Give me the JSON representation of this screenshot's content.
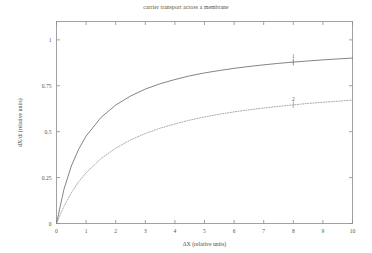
{
  "chart_data": {
    "type": "line",
    "title": "carrier transport across a membrane",
    "xlabel": "ΔX (relative units)",
    "ylabel": "dX/dt (relative units)",
    "xlim": [
      0,
      10
    ],
    "ylim": [
      0,
      1.1
    ],
    "grid": false,
    "legend": "inline-curve-labels",
    "xticks": [
      "0",
      "1",
      "2",
      "3",
      "4",
      "5",
      "6",
      "7",
      "8",
      "9",
      "10"
    ],
    "xtick_values": [
      0,
      1,
      2,
      3,
      4,
      5,
      6,
      7,
      8,
      9,
      10
    ],
    "yticks": [
      "0",
      "0.25",
      "0.5",
      "0.75",
      "1"
    ],
    "ytick_values": [
      0,
      0.25,
      0.5,
      0.75,
      1
    ],
    "x": [
      0,
      0.25,
      0.5,
      0.75,
      1,
      1.5,
      2,
      2.5,
      3,
      3.5,
      4,
      4.5,
      5,
      5.5,
      6,
      6.5,
      7,
      7.5,
      8,
      8.5,
      9,
      9.5,
      10
    ],
    "series": [
      {
        "name": "1",
        "label": "1",
        "label_x": 8,
        "style": "solid",
        "color": "#6e6e6e",
        "vmax": 1.0,
        "km": 1.1,
        "values": [
          0,
          0.185,
          0.313,
          0.405,
          0.476,
          0.577,
          0.645,
          0.694,
          0.732,
          0.761,
          0.784,
          0.804,
          0.82,
          0.833,
          0.845,
          0.855,
          0.864,
          0.872,
          0.879,
          0.885,
          0.891,
          0.896,
          0.901
        ]
      },
      {
        "name": "2",
        "label": "2",
        "label_x": 8,
        "style": "dotted",
        "color": "#9a9a9a",
        "vmax": 0.8,
        "km": 1.9,
        "values": [
          0,
          0.093,
          0.167,
          0.227,
          0.276,
          0.353,
          0.41,
          0.455,
          0.49,
          0.519,
          0.542,
          0.563,
          0.58,
          0.595,
          0.608,
          0.619,
          0.629,
          0.638,
          0.646,
          0.654,
          0.66,
          0.666,
          0.672
        ]
      }
    ]
  }
}
